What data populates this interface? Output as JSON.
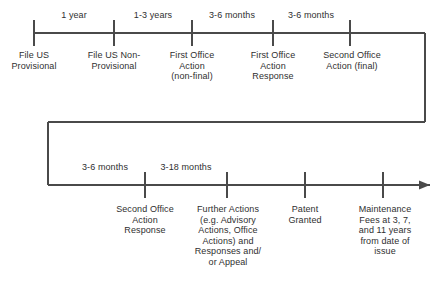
{
  "diagram": {
    "type": "timeline",
    "line_color": "#4a4a4a",
    "text_color": "#2f2f2f",
    "background_color": "#ffffff",
    "rows": [
      {
        "name": "row-one",
        "axis_y": 33,
        "start_x": 34,
        "end_x": 425,
        "ticks_x": [
          34,
          114,
          192,
          273,
          350
        ],
        "intervals": [
          {
            "label": "1 year",
            "from_x": 34,
            "to_x": 114,
            "center_x": 74,
            "y": 10
          },
          {
            "label": "1-3 years",
            "from_x": 114,
            "to_x": 192,
            "center_x": 153,
            "y": 10
          },
          {
            "label": "3-6 months",
            "from_x": 192,
            "to_x": 273,
            "center_x": 232,
            "y": 10
          },
          {
            "label": "3-6 months",
            "from_x": 273,
            "to_x": 350,
            "center_x": 311,
            "y": 10
          }
        ],
        "events": [
          {
            "label": "File US\nProvisional",
            "x": 34,
            "y": 50,
            "width": 70
          },
          {
            "label": "File US Non-\nProvisional",
            "x": 114,
            "y": 50,
            "width": 76
          },
          {
            "label": "First Office\nAction\n(non-final)",
            "x": 192,
            "y": 50,
            "width": 74
          },
          {
            "label": "First Office\nAction\nResponse",
            "x": 273,
            "y": 50,
            "width": 74
          },
          {
            "label": "Second Office\nAction (final)",
            "x": 352,
            "y": 50,
            "width": 86
          }
        ]
      },
      {
        "name": "row-two",
        "axis_y": 185,
        "start_x": 48,
        "end_x": 430,
        "ticks_x": [
          145,
          227,
          305,
          383
        ],
        "intervals": [
          {
            "label": "3-6 months",
            "from_x": 65,
            "to_x": 145,
            "center_x": 105,
            "y": 162
          },
          {
            "label": "3-18 months",
            "from_x": 145,
            "to_x": 227,
            "center_x": 186,
            "y": 162
          }
        ],
        "events": [
          {
            "label": "Second Office\nAction\nResponse",
            "x": 145,
            "y": 204,
            "width": 84
          },
          {
            "label": "Further Actions\n(e.g. Advisory\nActions, Office\nActions) and\nResponses and/\nor Appeal",
            "x": 228,
            "y": 204,
            "width": 90
          },
          {
            "label": "Patent\nGranted",
            "x": 305,
            "y": 204,
            "width": 64
          },
          {
            "label": "Maintenance\nFees at 3, 7,\nand 11 years\nfrom date of\nissue",
            "x": 385,
            "y": 204,
            "width": 82
          }
        ]
      }
    ],
    "connector": {
      "name": "row-wrap-connector",
      "description": "elbow joining end of row one to start of row two",
      "from_x": 425,
      "from_y": 33,
      "corner_y": 122,
      "to_x": 48,
      "to_y": 185
    },
    "arrow": {
      "name": "timeline-arrowhead",
      "tip_x": 430,
      "tip_y": 185,
      "direction": "right"
    }
  }
}
